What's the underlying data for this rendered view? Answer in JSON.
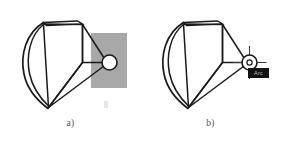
{
  "figure": {
    "background_color": "#ffffff",
    "line_color": "#1a1a1a",
    "selection_fill": "#a8a8a8",
    "tooltip_background": "#121212",
    "tooltip_text_color": "#b9b9b9"
  },
  "panels": [
    {
      "id": "a",
      "caption": "a)",
      "selection_rectangle": {
        "visible": "true",
        "x": 91,
        "y": 33,
        "width": 36,
        "height": 55,
        "fill": "#a8a8a8"
      },
      "crosshair_visible": "false",
      "tooltip": {
        "visible": "false",
        "text": ""
      }
    },
    {
      "id": "b",
      "caption": "b)",
      "selection_rectangle": {
        "visible": "false",
        "x": 0,
        "y": 0,
        "width": 0,
        "height": 0,
        "fill": "#a8a8a8"
      },
      "crosshair_visible": "true",
      "tooltip": {
        "visible": "true",
        "text": "Arc"
      }
    }
  ],
  "geometry": {
    "outer_arc_label": "outer-arc-edge",
    "inner_arc_label": "inner-arc-edge",
    "top_face_label": "top-quad-face",
    "side_face_label": "side-quad-face",
    "lower_face_label": "lower-triangle-face",
    "hub_circle_label": "hub-circle"
  }
}
